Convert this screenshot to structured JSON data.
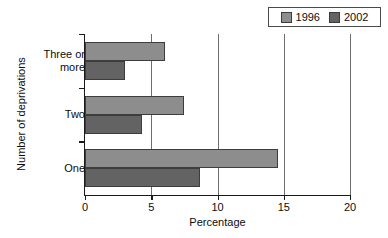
{
  "chart_data": {
    "type": "bar",
    "orientation": "horizontal",
    "title": "",
    "xlabel": "Percentage",
    "ylabel": "Number of deprivations",
    "categories": [
      "One",
      "Two",
      "Three or more"
    ],
    "category_labels": [
      {
        "line1": "Three or",
        "line2": "more"
      },
      {
        "line1": "Two",
        "line2": ""
      },
      {
        "line1": "One",
        "line2": ""
      }
    ],
    "series": [
      {
        "name": "1996",
        "color": "#8d8d8d",
        "values": [
          14.6,
          7.5,
          6.0
        ]
      },
      {
        "name": "2002",
        "color": "#636363",
        "values": [
          8.7,
          4.3,
          3.0
        ]
      }
    ],
    "xlim": [
      0,
      20
    ],
    "xticks": [
      0,
      5,
      10,
      15,
      20
    ],
    "xtick_labels": [
      "0",
      "5",
      "10",
      "15",
      "20"
    ],
    "grid": true,
    "grid_axis": "x",
    "legend_position": "top-right",
    "legend_entries": [
      {
        "label": "1996",
        "color": "#8d8d8d"
      },
      {
        "label": "2002",
        "color": "#636363"
      }
    ]
  }
}
